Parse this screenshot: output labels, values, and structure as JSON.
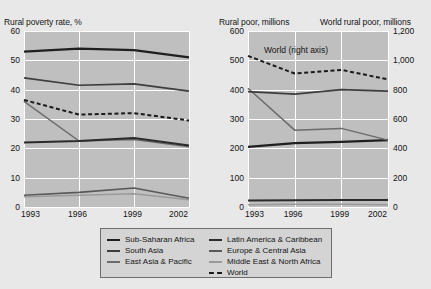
{
  "chart_data": [
    {
      "type": "line",
      "title": "Rural poverty rate, %",
      "xlabel": "",
      "ylabel": "Rural poverty rate, %",
      "x": [
        "1993",
        "1996",
        "1999",
        "2002"
      ],
      "ylim": [
        0,
        60
      ],
      "yticks": [
        "0",
        "10",
        "20",
        "30",
        "40",
        "50",
        "60"
      ],
      "grid": true,
      "legend_position": "bottom",
      "series": [
        {
          "name": "Sub-Saharan Africa",
          "values": [
            53,
            54,
            53.5,
            51
          ]
        },
        {
          "name": "South Asia",
          "values": [
            44,
            41.5,
            42,
            39.5
          ]
        },
        {
          "name": "East Asia & Pacific",
          "values": [
            36,
            22.5,
            23,
            20.5
          ]
        },
        {
          "name": "Latin America & Caribbean",
          "values": [
            22,
            22.5,
            23.5,
            21
          ]
        },
        {
          "name": "Europe & Central Asia",
          "values": [
            4,
            5,
            6.5,
            3
          ]
        },
        {
          "name": "Middle East & North Africa",
          "values": [
            3.5,
            4,
            4.5,
            2.5
          ]
        },
        {
          "name": "World",
          "values": [
            36.5,
            31.5,
            32,
            29.5
          ]
        }
      ]
    },
    {
      "type": "line",
      "title": "Rural poor, millions",
      "title_right": "World rural poor, millions",
      "xlabel": "",
      "ylabel": "Rural poor, millions",
      "ylabel_right": "World rural poor, millions",
      "x": [
        "1993",
        "1996",
        "1999",
        "2002"
      ],
      "ylim": [
        0,
        600
      ],
      "yticks": [
        "0",
        "100",
        "200",
        "300",
        "400",
        "500",
        "600"
      ],
      "ylim_right": [
        0,
        1200
      ],
      "yticks_right": [
        "0",
        "200",
        "400",
        "600",
        "800",
        "1,000",
        "1,200"
      ],
      "grid": true,
      "annotation": "World (right axis)",
      "series": [
        {
          "name": "East Asia & Pacific",
          "values": [
            405,
            262,
            268,
            228
          ],
          "axis": "left"
        },
        {
          "name": "South Asia",
          "values": [
            393,
            385,
            400,
            395
          ],
          "axis": "left"
        },
        {
          "name": "Sub-Saharan Africa",
          "values": [
            205,
            218,
            222,
            228
          ],
          "axis": "left"
        },
        {
          "name": "Latin America & Caribbean",
          "values": [
            22,
            23,
            24,
            24
          ],
          "axis": "left"
        },
        {
          "name": "Middle East & North Africa",
          "values": [
            8,
            9,
            9,
            8
          ],
          "axis": "left"
        },
        {
          "name": "World",
          "values": [
            1030,
            910,
            935,
            870
          ],
          "axis": "right"
        }
      ]
    }
  ],
  "left_chart": {
    "axis_title": "Rural poverty rate, %",
    "yticks": [
      "60",
      "50",
      "40",
      "30",
      "20",
      "10",
      "0"
    ],
    "xticks": [
      "1993",
      "1996",
      "1999",
      "2002"
    ]
  },
  "right_chart": {
    "axis_title_left": "Rural poor, millions",
    "axis_title_right": "World rural poor, millions",
    "yticks_left": [
      "600",
      "500",
      "400",
      "300",
      "200",
      "100",
      "0"
    ],
    "yticks_right": [
      "1,200",
      "1,000",
      "800",
      "600",
      "400",
      "200",
      "0"
    ],
    "xticks": [
      "1993",
      "1996",
      "1999",
      "2002"
    ],
    "annotation": "World (right axis)"
  },
  "legend": {
    "col1": [
      {
        "label": "Sub-Saharan Africa",
        "style": "solid",
        "color": "#1f1f1f",
        "width": 2.2
      },
      {
        "label": "South Asia",
        "style": "solid",
        "color": "#3d3d3d",
        "width": 1.7
      },
      {
        "label": "East Asia & Pacific",
        "style": "solid",
        "color": "#6b6b6b",
        "width": 1.5
      }
    ],
    "col2": [
      {
        "label": "Latin America & Caribbean",
        "style": "solid",
        "color": "#2b2b2b",
        "width": 2.0
      },
      {
        "label": "Europe & Central Asia",
        "style": "solid",
        "color": "#595959",
        "width": 1.6
      },
      {
        "label": "Middle East & North Africa",
        "style": "solid",
        "color": "#9a9a9a",
        "width": 1.5
      },
      {
        "label": "World",
        "style": "dashed",
        "color": "#1a1a1a",
        "width": 2.0
      }
    ]
  },
  "colors": {
    "page_background": "#e8e8e8",
    "plot_background": "#bfbfbf",
    "gridline": "#ffffff",
    "text": "#141414",
    "legend_background": "#d4d4d4",
    "legend_border": "#6e6e6e"
  }
}
